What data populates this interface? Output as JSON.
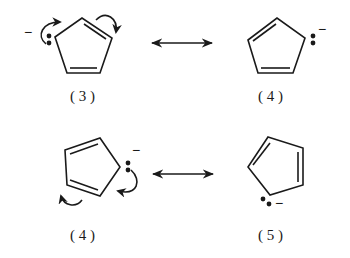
{
  "diagram": {
    "structures": [
      {
        "id": "s3-top",
        "label": "( 3 )",
        "charge": "−",
        "lone_pair": true,
        "curved_arrows": 2
      },
      {
        "id": "s4-top",
        "label": "( 4 )",
        "charge": "−",
        "lone_pair": true,
        "curved_arrows": 0
      },
      {
        "id": "s4-bottom",
        "label": "( 4 )",
        "charge": "−",
        "lone_pair": true,
        "curved_arrows": 2
      },
      {
        "id": "s5-bottom",
        "label": "( 5 )",
        "charge": "−",
        "lone_pair": true,
        "curved_arrows": 0
      }
    ],
    "resonance_arrows": [
      {
        "from": "s3-top",
        "to": "s4-top",
        "symbol": "↔"
      },
      {
        "from": "s4-bottom",
        "to": "s5-bottom",
        "symbol": "↔"
      }
    ],
    "colors": {
      "ink": "#1a1a1a",
      "background": "#ffffff"
    }
  }
}
